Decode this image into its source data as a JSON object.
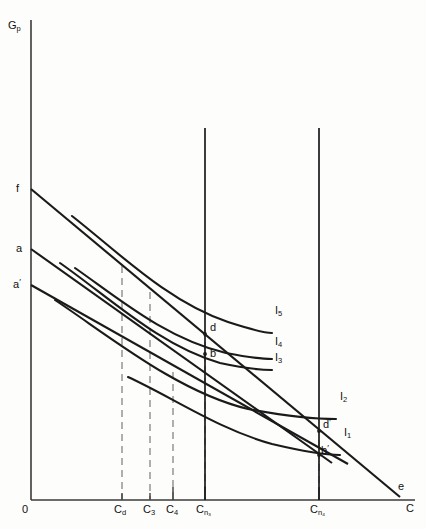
{
  "figure": {
    "type": "economics-indifference-curve-diagram",
    "axes": {
      "y_label": "G",
      "y_label_sub": "p",
      "x_label": "C",
      "origin_label": "0",
      "y_axis_x": 31,
      "x_axis_y": 500,
      "y_top": 20,
      "x_right": 415
    },
    "y_intercepts": [
      {
        "name": "f",
        "label": "f",
        "label_sup": "",
        "y": 189
      },
      {
        "name": "a",
        "label": "a",
        "label_sup": "",
        "y": 249
      },
      {
        "name": "ap",
        "label": "a",
        "label_sup": "′",
        "y": 285
      }
    ],
    "x_ticks": [
      {
        "name": "Cd",
        "label": "C",
        "sub": "d",
        "x": 122,
        "dashed": true
      },
      {
        "name": "C3",
        "label": "C",
        "sub": "3",
        "x": 150,
        "dashed": true
      },
      {
        "name": "C4",
        "label": "C",
        "sub": "4",
        "x": 173,
        "dashed": true
      },
      {
        "name": "Cn3",
        "label": "C",
        "sub": "n₃",
        "x": 205,
        "dashed": true
      },
      {
        "name": "Cn4",
        "label": "C",
        "sub": "n₄",
        "x": 319,
        "dashed": true
      }
    ],
    "vertical_constraint_lines": [
      {
        "name": "cn3-constraint",
        "x": 205,
        "y_top": 128,
        "y_bottom": 500
      },
      {
        "name": "cn4-constraint",
        "x": 319,
        "y_top": 128,
        "y_bottom": 500
      }
    ],
    "budget_lines": [
      {
        "name": "line-f-e",
        "from": "f",
        "x1": 31,
        "y1": 189,
        "x2": 400,
        "y2": 497
      },
      {
        "name": "line-a",
        "from": "a",
        "x1": 31,
        "y1": 249,
        "x2": 330,
        "y2": 462
      },
      {
        "name": "line-a-prime",
        "from": "a-prime",
        "x1": 31,
        "y1": 285,
        "x2": 345,
        "y2": 462
      }
    ],
    "indifference_curves": [
      {
        "name": "I5",
        "label": "I",
        "sub": "5",
        "label_x": 275,
        "label_y": 305,
        "path": "M 72,216 C 120,250 170,300 230,322 C 258,331 268,333 272,333"
      },
      {
        "name": "I4",
        "label": "I",
        "sub": "4",
        "label_x": 275,
        "label_y": 336,
        "path": "M 75,268 C 118,296 165,338 225,352 C 252,357 266,358 272,358"
      },
      {
        "name": "I3",
        "label": "I",
        "sub": "3",
        "label_x": 275,
        "label_y": 351,
        "path": "M 60,263 C 110,296 160,345 220,362 C 248,368 266,369 272,369"
      },
      {
        "name": "I2",
        "label": "I",
        "sub": "2",
        "label_x": 340,
        "label_y": 391,
        "path": "M 55,300 C 110,335 175,390 245,407 C 290,416 322,418 336,418"
      },
      {
        "name": "I1",
        "label": "I",
        "sub": "1",
        "label_x": 343,
        "label_y": 427,
        "path": "M 128,377 C 170,395 215,427 270,443 C 305,452 330,455 340,455"
      }
    ],
    "points": [
      {
        "name": "point-d",
        "label": "d",
        "sup": "",
        "x": 211,
        "y": 325,
        "dot_x": 205,
        "dot_y": 334
      },
      {
        "name": "point-b",
        "label": "b",
        "sup": "",
        "x": 211,
        "y": 349,
        "dot_x": 205,
        "dot_y": 354
      },
      {
        "name": "point-d-prime",
        "label": "d",
        "sup": "′",
        "x": 324,
        "y": 421,
        "dot_x": 319,
        "dot_y": 431
      },
      {
        "name": "point-b-prime",
        "label": "b",
        "sup": "′",
        "x": 322,
        "y": 446,
        "dot_x": 319,
        "dot_y": 455
      }
    ],
    "endpoint_e": {
      "name": "point-e",
      "label": "e",
      "x": 400,
      "y": 484
    },
    "colors": {
      "stroke": "#1a1a1a",
      "axis": "#3a3a3a",
      "dashed": "#8d8d8d",
      "background": "#fdfdfb"
    }
  }
}
